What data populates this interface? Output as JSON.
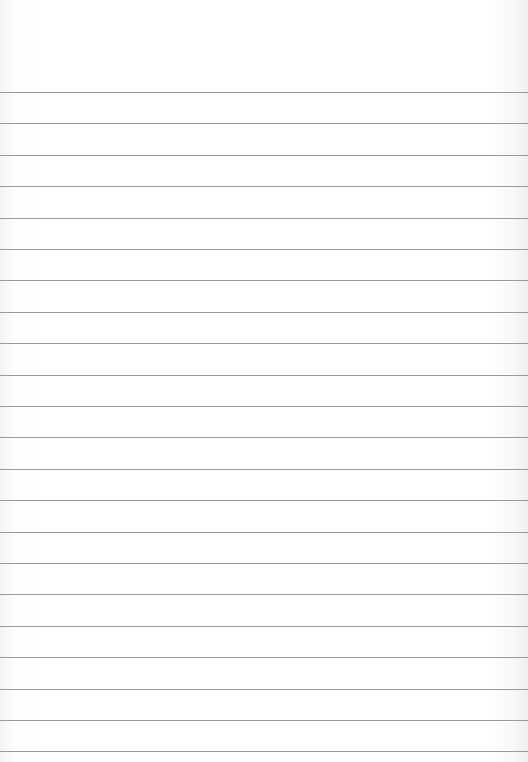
{
  "image": {
    "description": "Blank sheet of ruled notebook paper",
    "background_color": "#ffffff",
    "line_color": "#8a8a8a",
    "ruled_lines": {
      "count": 22,
      "first_y": 92,
      "spacing": 31.4,
      "left": 0,
      "right": 528
    }
  }
}
